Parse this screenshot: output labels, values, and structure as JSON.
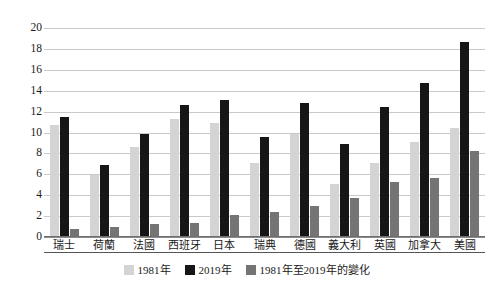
{
  "chart_data": {
    "type": "bar",
    "title": "",
    "xlabel": "",
    "ylabel": "",
    "ylim": [
      0,
      20
    ],
    "ytick_step": 2,
    "yticks": [
      "0",
      "2",
      "4",
      "6",
      "8",
      "10",
      "12",
      "14",
      "16",
      "18",
      "20"
    ],
    "grid": true,
    "legend_position": "bottom",
    "categories": [
      "瑞士",
      "荷蘭",
      "法國",
      "西班牙",
      "日本",
      "瑞典",
      "德國",
      "義大利",
      "英國",
      "加拿大",
      "美國"
    ],
    "series": [
      {
        "name": "1981年",
        "color": "#d4d4d4",
        "values": [
          10.7,
          5.9,
          8.6,
          11.3,
          10.9,
          7.1,
          9.9,
          5.1,
          7.1,
          9.1,
          10.45
        ]
      },
      {
        "name": "2019年",
        "color": "#161616",
        "values": [
          11.5,
          6.9,
          9.9,
          12.6,
          13.1,
          9.55,
          12.85,
          8.9,
          12.4,
          14.75,
          18.7
        ]
      },
      {
        "name": "1981年至2019年的變化",
        "color": "#747474",
        "values": [
          0.8,
          1.0,
          1.25,
          1.3,
          2.15,
          2.35,
          2.95,
          3.75,
          5.3,
          5.6,
          8.25
        ]
      }
    ]
  },
  "colors": {
    "series_1981": "#d4d4d4",
    "series_2019": "#161616",
    "series_change": "#747474",
    "gridline": "#c9c9c9",
    "axis": "#6f6f6f",
    "text": "#1a1a1a",
    "background": "#ffffff"
  }
}
